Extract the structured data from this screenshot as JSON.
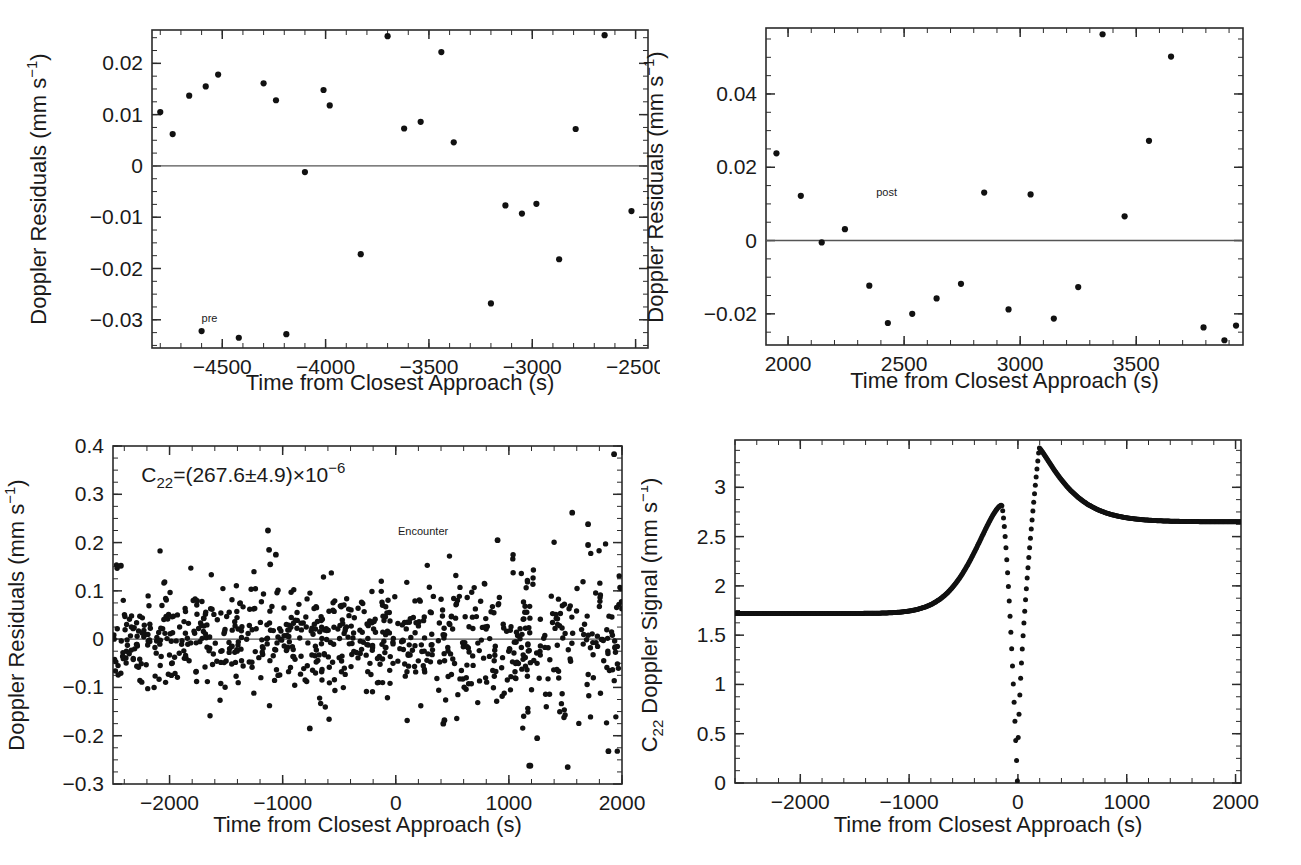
{
  "figure": {
    "panels": [
      "pre-encounter-residuals",
      "post-encounter-residuals",
      "encounter-residuals",
      "c22-doppler-signal"
    ]
  },
  "chart_data": [
    {
      "id": "panel-top-left",
      "type": "scatter",
      "title": "",
      "xlabel": "Time from Closest Approach (s)",
      "ylabel": "Doppler Residuals (mm s−1)",
      "ylabel_display": "Doppler Residuals (mm s",
      "ylabel_exp": "−1",
      "ylabel_tail": ")",
      "xlim": [
        -4840,
        -2440
      ],
      "ylim": [
        -0.0355,
        0.0265
      ],
      "xticks": [
        -4500,
        -4000,
        -3500,
        -3000,
        -2500
      ],
      "xticklabels": [
        "−4500",
        "−4000",
        "−3500",
        "−3000",
        "−2500"
      ],
      "yticks": [
        0.02,
        0.01,
        0,
        -0.01,
        -0.02,
        -0.03
      ],
      "yticklabels": [
        "0.02",
        "0.01",
        "0",
        "−0.01",
        "−0.02",
        "−0.03"
      ],
      "xminor": 100,
      "yminor": 0.0025,
      "zeroline": 0,
      "grid": false,
      "legend": "none",
      "annotations": [
        {
          "text": "pre",
          "x": -4600,
          "y": -0.0305,
          "size": "small"
        }
      ],
      "points": [
        {
          "x": -4800,
          "y": 0.0105
        },
        {
          "x": -4740,
          "y": 0.0062
        },
        {
          "x": -4660,
          "y": 0.0137
        },
        {
          "x": -4580,
          "y": 0.0155
        },
        {
          "x": -4600,
          "y": -0.0322
        },
        {
          "x": -4520,
          "y": 0.0178
        },
        {
          "x": -4420,
          "y": -0.0335
        },
        {
          "x": -4300,
          "y": 0.0161
        },
        {
          "x": -4240,
          "y": 0.0128
        },
        {
          "x": -4190,
          "y": -0.0328
        },
        {
          "x": -4100,
          "y": -0.0012
        },
        {
          "x": -4010,
          "y": 0.0148
        },
        {
          "x": -3980,
          "y": 0.0118
        },
        {
          "x": -3830,
          "y": -0.0172
        },
        {
          "x": -3700,
          "y": 0.0253
        },
        {
          "x": -3620,
          "y": 0.0073
        },
        {
          "x": -3540,
          "y": 0.0086
        },
        {
          "x": -3440,
          "y": 0.0222
        },
        {
          "x": -3380,
          "y": 0.0046
        },
        {
          "x": -3200,
          "y": -0.0268
        },
        {
          "x": -3130,
          "y": -0.0077
        },
        {
          "x": -3050,
          "y": -0.0093
        },
        {
          "x": -2980,
          "y": -0.0074
        },
        {
          "x": -2870,
          "y": -0.0182
        },
        {
          "x": -2790,
          "y": 0.0072
        },
        {
          "x": -2650,
          "y": 0.0255
        },
        {
          "x": -2520,
          "y": -0.0088
        }
      ]
    },
    {
      "id": "panel-top-right",
      "type": "scatter",
      "title": "",
      "xlabel": "Time from Closest Approach (s)",
      "ylabel": "Doppler Residuals (mm s−1)",
      "xlim": [
        1905,
        3960
      ],
      "ylim": [
        -0.0285,
        0.058
      ],
      "xticks": [
        2000,
        2500,
        3000,
        3500
      ],
      "xticklabels": [
        "2000",
        "2500",
        "3000",
        "3500"
      ],
      "yticks": [
        0.04,
        0.02,
        0,
        -0.02
      ],
      "yticklabels": [
        "0.04",
        "0.02",
        "0",
        "−0.02"
      ],
      "xminor": 100,
      "yminor": 0.005,
      "zeroline": 0,
      "grid": false,
      "legend": "none",
      "annotations": [
        {
          "text": "post",
          "x": 2380,
          "y": 0.0122,
          "size": "small"
        }
      ],
      "points": [
        {
          "x": 1950,
          "y": 0.0238
        },
        {
          "x": 2055,
          "y": 0.0122
        },
        {
          "x": 2145,
          "y": -0.0005
        },
        {
          "x": 2245,
          "y": 0.0031
        },
        {
          "x": 2350,
          "y": -0.0123
        },
        {
          "x": 2430,
          "y": -0.0225
        },
        {
          "x": 2535,
          "y": -0.02
        },
        {
          "x": 2640,
          "y": -0.0158
        },
        {
          "x": 2745,
          "y": -0.0118
        },
        {
          "x": 2845,
          "y": 0.0131
        },
        {
          "x": 2950,
          "y": -0.0188
        },
        {
          "x": 3045,
          "y": 0.0126
        },
        {
          "x": 3145,
          "y": -0.0213
        },
        {
          "x": 3250,
          "y": -0.0127
        },
        {
          "x": 3355,
          "y": 0.0563
        },
        {
          "x": 3450,
          "y": 0.0066
        },
        {
          "x": 3555,
          "y": 0.0272
        },
        {
          "x": 3650,
          "y": 0.0502
        },
        {
          "x": 3790,
          "y": -0.0237
        },
        {
          "x": 3880,
          "y": -0.0272
        },
        {
          "x": 3930,
          "y": -0.0232
        }
      ]
    },
    {
      "id": "panel-bottom-left",
      "type": "scatter",
      "title": "",
      "xlabel": "Time from Closest Approach (s)",
      "ylabel": "Doppler Residuals (mm s−1)",
      "xlim": [
        -2500,
        2000
      ],
      "ylim": [
        -0.3,
        0.4
      ],
      "xticks": [
        -2000,
        -1000,
        0,
        1000,
        2000
      ],
      "xticklabels": [
        "−2000",
        "−1000",
        "0",
        "1000",
        "2000"
      ],
      "yticks": [
        0.4,
        0.3,
        0.2,
        0.1,
        0,
        -0.1,
        -0.2,
        -0.3
      ],
      "yticklabels": [
        "0.4",
        "0.3",
        "0.2",
        "0.1",
        "0",
        "−0.1",
        "−0.2",
        "−0.3"
      ],
      "xminor": 200,
      "yminor": 0.025,
      "zeroline": 0,
      "grid": false,
      "legend": "none",
      "npoints": 820,
      "noise_sigma_left": 0.055,
      "noise_sigma_right": 0.085,
      "annotations": [
        {
          "text": "C22=(267.6±4.9)×10−6",
          "x": -2250,
          "y": 0.325,
          "size": "big",
          "parts": {
            "lead": "C",
            "sub": "22",
            "mid": "=(267.6±4.9)×10",
            "sup": "−6"
          }
        },
        {
          "text": "Encounter",
          "x": 20,
          "y": 0.215,
          "size": "small"
        }
      ]
    },
    {
      "id": "panel-bottom-right",
      "type": "line",
      "title": "",
      "xlabel": "Time from Closest Approach (s)",
      "ylabel": "C22 Doppler Signal (mm s−1)",
      "ylabel_parts": {
        "lead": "C",
        "sub": "22",
        "mid": " Doppler Signal (mm s",
        "sup": "−1",
        "tail": ")"
      },
      "xlim": [
        -2600,
        2050
      ],
      "ylim": [
        0,
        3.48
      ],
      "xticks": [
        -2000,
        -1000,
        0,
        1000,
        2000
      ],
      "xticklabels": [
        "−2000",
        "−1000",
        "0",
        "1000",
        "2000"
      ],
      "yticks": [
        3,
        2.5,
        2,
        1.5,
        1,
        0.5,
        0
      ],
      "yticklabels": [
        "3",
        "2.5",
        "2",
        "1.5",
        "1",
        "0.5",
        "0"
      ],
      "xminor": 200,
      "yminor": 0.125,
      "grid": false,
      "legend": "none",
      "baseline_left": 1.72,
      "peak1": {
        "x": -150,
        "y": 2.82
      },
      "trough": {
        "x": -5,
        "y": 0.02
      },
      "peak2": {
        "x": 195,
        "y": 3.4
      },
      "baseline_right": 2.65,
      "annotations": []
    }
  ]
}
